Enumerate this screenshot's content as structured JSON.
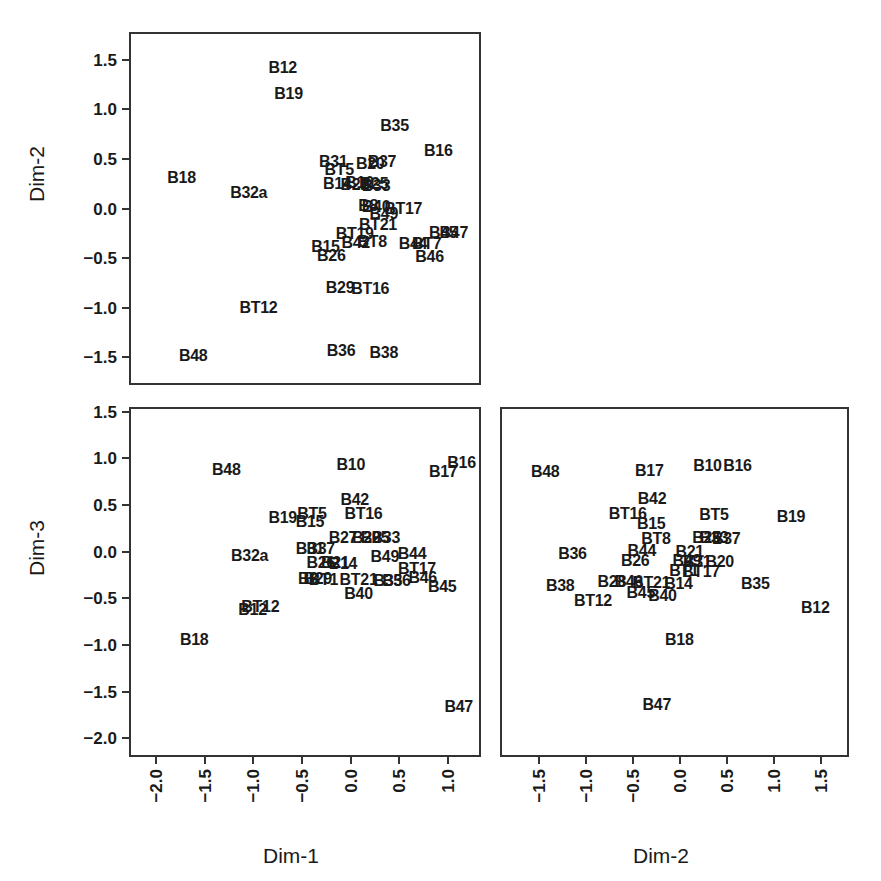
{
  "figure": {
    "type": "scatter-plot-matrix",
    "panel_count": 3,
    "label_only_markers": true
  },
  "axis_titles": {
    "dim1": "Dim-1",
    "dim2_left": "Dim-2",
    "dim2_bottom": "Dim-2",
    "dim3": "Dim-3"
  },
  "ticks": {
    "dim2_y": [
      "1.5",
      "1.0",
      "0.5",
      "0.0",
      "−0.5",
      "−1.0",
      "−1.5"
    ],
    "dim3_y": [
      "1.5",
      "1.0",
      "0.5",
      "0.0",
      "−0.5",
      "−1.0",
      "−1.5",
      "−2.0"
    ],
    "dim1_x": [
      "−2.0",
      "−1.5",
      "−1.0",
      "−0.5",
      "0.0",
      "0.5",
      "1.0"
    ],
    "dim2_x": [
      "−1.5",
      "−1.0",
      "−0.5",
      "0.0",
      "0.5",
      "1.0",
      "1.5"
    ]
  },
  "chart_data": [
    {
      "type": "scatter",
      "name": "Dim-2 vs Dim-1",
      "xlabel": "Dim-1",
      "ylabel": "Dim-2",
      "xlim": [
        -2.28,
        1.34
      ],
      "ylim": [
        -1.78,
        1.78
      ],
      "grid": false,
      "legend": "none",
      "xticks": [
        -2.0,
        -1.5,
        -1.0,
        -0.5,
        0.0,
        0.5,
        1.0
      ],
      "yticks": [
        1.5,
        1.0,
        0.5,
        0.0,
        -0.5,
        -1.0,
        -1.5
      ],
      "points": [
        {
          "label": "B12",
          "x": -0.72,
          "y": 1.44
        },
        {
          "label": "B19",
          "x": -0.66,
          "y": 1.17
        },
        {
          "label": "B35",
          "x": 0.43,
          "y": 0.85
        },
        {
          "label": "B16",
          "x": 0.88,
          "y": 0.6
        },
        {
          "label": "B31",
          "x": -0.2,
          "y": 0.49
        },
        {
          "label": "B37",
          "x": 0.3,
          "y": 0.49
        },
        {
          "label": "B20",
          "x": 0.18,
          "y": 0.47
        },
        {
          "label": "BT5",
          "x": -0.14,
          "y": 0.41
        },
        {
          "label": "B18",
          "x": -1.76,
          "y": 0.33
        },
        {
          "label": "B14",
          "x": -0.16,
          "y": 0.27
        },
        {
          "label": "B10",
          "x": 0.07,
          "y": 0.28
        },
        {
          "label": "B21",
          "x": 0.02,
          "y": 0.26
        },
        {
          "label": "B25",
          "x": 0.22,
          "y": 0.27
        },
        {
          "label": "B33",
          "x": 0.24,
          "y": 0.25
        },
        {
          "label": "B32a",
          "x": -1.07,
          "y": 0.18
        },
        {
          "label": "B8",
          "x": 0.16,
          "y": 0.05
        },
        {
          "label": "B40",
          "x": 0.24,
          "y": 0.04
        },
        {
          "label": "BT17",
          "x": 0.52,
          "y": 0.02
        },
        {
          "label": "B49",
          "x": 0.32,
          "y": -0.04
        },
        {
          "label": "BT21",
          "x": 0.26,
          "y": -0.15
        },
        {
          "label": "BT19",
          "x": 0.02,
          "y": -0.24
        },
        {
          "label": "B45",
          "x": 0.93,
          "y": -0.23
        },
        {
          "label": "B47",
          "x": 1.04,
          "y": -0.23
        },
        {
          "label": "B15",
          "x": -0.28,
          "y": -0.37
        },
        {
          "label": "B42",
          "x": 0.03,
          "y": -0.33
        },
        {
          "label": "BT8",
          "x": 0.2,
          "y": -0.32
        },
        {
          "label": "B44",
          "x": 0.62,
          "y": -0.34
        },
        {
          "label": "BT7",
          "x": 0.76,
          "y": -0.34
        },
        {
          "label": "B26",
          "x": -0.22,
          "y": -0.46
        },
        {
          "label": "B46",
          "x": 0.79,
          "y": -0.47
        },
        {
          "label": "B29",
          "x": -0.13,
          "y": -0.78
        },
        {
          "label": "BT16",
          "x": 0.18,
          "y": -0.79
        },
        {
          "label": "BT12",
          "x": -0.97,
          "y": -0.98
        },
        {
          "label": "B36",
          "x": -0.12,
          "y": -1.42
        },
        {
          "label": "B38",
          "x": 0.32,
          "y": -1.44
        },
        {
          "label": "B48",
          "x": -1.64,
          "y": -1.47
        }
      ]
    },
    {
      "type": "scatter",
      "name": "Dim-3 vs Dim-1",
      "xlabel": "Dim-1",
      "ylabel": "Dim-3",
      "xlim": [
        -2.28,
        1.34
      ],
      "ylim": [
        -2.2,
        1.55
      ],
      "grid": false,
      "legend": "none",
      "xticks": [
        -2.0,
        -1.5,
        -1.0,
        -0.5,
        0.0,
        0.5,
        1.0
      ],
      "yticks": [
        1.5,
        1.0,
        0.5,
        0.0,
        -0.5,
        -1.0,
        -1.5,
        -2.0
      ],
      "points": [
        {
          "label": "B10",
          "x": -0.02,
          "y": 0.95
        },
        {
          "label": "B16",
          "x": 1.12,
          "y": 0.97
        },
        {
          "label": "B48",
          "x": -1.3,
          "y": 0.9
        },
        {
          "label": "B17",
          "x": 0.93,
          "y": 0.88
        },
        {
          "label": "B42",
          "x": 0.02,
          "y": 0.58
        },
        {
          "label": "BT5",
          "x": -0.42,
          "y": 0.42
        },
        {
          "label": "BT16",
          "x": 0.11,
          "y": 0.43
        },
        {
          "label": "B19",
          "x": -0.72,
          "y": 0.38
        },
        {
          "label": "B15",
          "x": -0.44,
          "y": 0.34
        },
        {
          "label": "B27",
          "x": -0.1,
          "y": 0.17
        },
        {
          "label": "B20",
          "x": 0.14,
          "y": 0.17
        },
        {
          "label": "B25",
          "x": 0.23,
          "y": 0.17
        },
        {
          "label": "B33",
          "x": 0.34,
          "y": 0.17
        },
        {
          "label": "B31",
          "x": -0.44,
          "y": 0.05
        },
        {
          "label": "B37",
          "x": -0.33,
          "y": 0.05
        },
        {
          "label": "B44",
          "x": 0.61,
          "y": 0.0
        },
        {
          "label": "B49",
          "x": 0.33,
          "y": -0.04
        },
        {
          "label": "B32a",
          "x": -1.06,
          "y": -0.03
        },
        {
          "label": "B26",
          "x": -0.33,
          "y": -0.1
        },
        {
          "label": "B21",
          "x": -0.18,
          "y": -0.1
        },
        {
          "label": "B14",
          "x": -0.1,
          "y": -0.11
        },
        {
          "label": "BT17",
          "x": 0.66,
          "y": -0.16
        },
        {
          "label": "B8",
          "x": -0.46,
          "y": -0.27
        },
        {
          "label": "B29",
          "x": -0.36,
          "y": -0.27
        },
        {
          "label": "B46",
          "x": 0.72,
          "y": -0.26
        },
        {
          "label": "BT1",
          "x": -0.3,
          "y": -0.28
        },
        {
          "label": "BT21",
          "x": 0.06,
          "y": -0.28
        },
        {
          "label": "B35",
          "x": 0.36,
          "y": -0.29
        },
        {
          "label": "B36",
          "x": 0.45,
          "y": -0.29
        },
        {
          "label": "B45",
          "x": 0.92,
          "y": -0.36
        },
        {
          "label": "B40",
          "x": 0.06,
          "y": -0.43
        },
        {
          "label": "BT12",
          "x": -0.95,
          "y": -0.57
        },
        {
          "label": "B12",
          "x": -1.03,
          "y": -0.6
        },
        {
          "label": "B18",
          "x": -1.63,
          "y": -0.92
        },
        {
          "label": "B47",
          "x": 1.09,
          "y": -1.64
        }
      ]
    },
    {
      "type": "scatter",
      "name": "Dim-3 vs Dim-2",
      "xlabel": "Dim-2",
      "ylabel": "Dim-3",
      "xlim": [
        -1.92,
        1.8
      ],
      "ylim": [
        -2.2,
        1.55
      ],
      "grid": false,
      "legend": "none",
      "xticks": [
        -1.5,
        -1.0,
        -0.5,
        0.0,
        0.5,
        1.0,
        1.5
      ],
      "yticks": [
        1.5,
        1.0,
        0.5,
        0.0,
        -0.5,
        -1.0,
        -1.5,
        -2.0
      ],
      "points": [
        {
          "label": "B10",
          "x": 0.27,
          "y": 0.94
        },
        {
          "label": "B16",
          "x": 0.59,
          "y": 0.94
        },
        {
          "label": "B48",
          "x": -1.46,
          "y": 0.88
        },
        {
          "label": "B17",
          "x": -0.35,
          "y": 0.89
        },
        {
          "label": "B42",
          "x": -0.32,
          "y": 0.59
        },
        {
          "label": "BT16",
          "x": -0.58,
          "y": 0.43
        },
        {
          "label": "BT5",
          "x": 0.34,
          "y": 0.41
        },
        {
          "label": "B19",
          "x": 1.16,
          "y": 0.39
        },
        {
          "label": "B15",
          "x": -0.33,
          "y": 0.32
        },
        {
          "label": "BT8",
          "x": -0.28,
          "y": 0.16
        },
        {
          "label": "B25",
          "x": 0.26,
          "y": 0.17
        },
        {
          "label": "B33",
          "x": 0.34,
          "y": 0.17
        },
        {
          "label": "B37",
          "x": 0.47,
          "y": 0.16
        },
        {
          "label": "B36",
          "x": -1.17,
          "y": 0.0
        },
        {
          "label": "B44",
          "x": -0.43,
          "y": 0.03
        },
        {
          "label": "B21",
          "x": 0.08,
          "y": 0.02
        },
        {
          "label": "B26",
          "x": -0.5,
          "y": -0.08
        },
        {
          "label": "B49",
          "x": 0.05,
          "y": -0.08
        },
        {
          "label": "B31",
          "x": 0.16,
          "y": -0.09
        },
        {
          "label": "B20",
          "x": 0.4,
          "y": -0.09
        },
        {
          "label": "BT1",
          "x": 0.02,
          "y": -0.19
        },
        {
          "label": "BT17",
          "x": 0.2,
          "y": -0.2
        },
        {
          "label": "B28",
          "x": -0.75,
          "y": -0.3
        },
        {
          "label": "B46",
          "x": -0.57,
          "y": -0.3
        },
        {
          "label": "BT21",
          "x": -0.33,
          "y": -0.31
        },
        {
          "label": "B14",
          "x": -0.04,
          "y": -0.32
        },
        {
          "label": "B38",
          "x": -1.3,
          "y": -0.35
        },
        {
          "label": "B35",
          "x": 0.78,
          "y": -0.33
        },
        {
          "label": "B45",
          "x": -0.44,
          "y": -0.42
        },
        {
          "label": "B40",
          "x": -0.21,
          "y": -0.45
        },
        {
          "label": "BT12",
          "x": -0.95,
          "y": -0.51
        },
        {
          "label": "B12",
          "x": 1.42,
          "y": -0.58
        },
        {
          "label": "B18",
          "x": -0.03,
          "y": -0.92
        },
        {
          "label": "B47",
          "x": -0.27,
          "y": -1.62
        }
      ]
    }
  ]
}
